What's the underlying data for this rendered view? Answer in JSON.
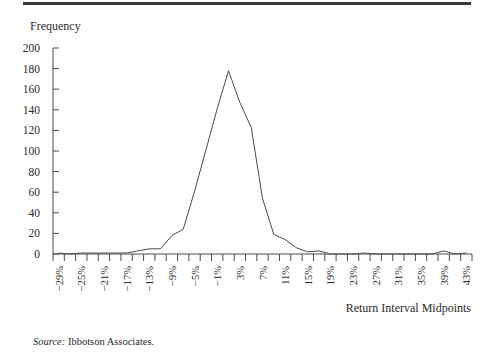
{
  "chart_data": {
    "type": "line",
    "title": "",
    "ylabel": "Frequency",
    "xlabel": "Return Interval Midpoints",
    "ylim": [
      0,
      200
    ],
    "yticks": [
      0,
      20,
      40,
      60,
      80,
      100,
      120,
      140,
      160,
      180,
      200
    ],
    "grid": false,
    "legend": null,
    "x": [
      "-29%",
      "-27%",
      "-25%",
      "-23%",
      "-21%",
      "-19%",
      "-17%",
      "-15%",
      "-13%",
      "-11%",
      "-9%",
      "-7%",
      "-5%",
      "-3%",
      "-1%",
      "1%",
      "3%",
      "5%",
      "7%",
      "9%",
      "11%",
      "13%",
      "15%",
      "17%",
      "19%",
      "21%",
      "23%",
      "25%",
      "27%",
      "29%",
      "31%",
      "33%",
      "35%",
      "37%",
      "39%",
      "41%",
      "43%"
    ],
    "x_tick_labels": [
      "−29%",
      "−25%",
      "−21%",
      "−17%",
      "−13%",
      "−9%",
      "−5%",
      "−1%",
      "3%",
      "7%",
      "11%",
      "15%",
      "19%",
      "23%",
      "27%",
      "31%",
      "35%",
      "39%",
      "43%"
    ],
    "series": [
      {
        "name": "Frequency",
        "values": [
          1,
          0,
          1,
          1,
          1,
          1,
          1,
          3,
          5,
          5,
          18,
          24,
          61,
          101,
          141,
          178,
          147,
          123,
          54,
          19,
          14,
          6,
          2,
          3,
          0,
          0,
          0,
          1,
          0,
          0,
          0,
          0,
          0,
          0,
          3,
          0,
          1
        ]
      }
    ]
  },
  "labels": {
    "y_axis_title": "Frequency",
    "x_axis_title": "Return Interval Midpoints",
    "source_prefix": "Source:",
    "source_text": " Ibbotson Associates."
  }
}
